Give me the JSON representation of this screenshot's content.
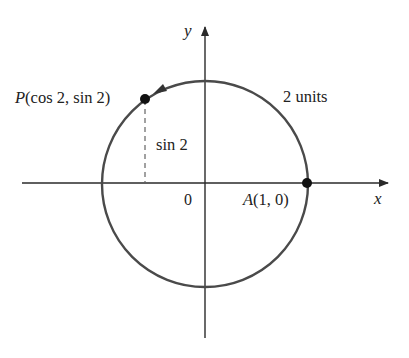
{
  "figure": {
    "type": "unit-circle-angle-diagram",
    "axes": {
      "x_label": "x",
      "y_label": "y",
      "origin_label": "0"
    },
    "points": {
      "P": {
        "name": "P",
        "coords_text": "(cos 2, sin 2)"
      },
      "A": {
        "name": "A",
        "coords_text": "(1, 0)"
      }
    },
    "annotations": {
      "arc_length": "2 units",
      "vertical_segment": "sin 2"
    },
    "colors": {
      "axis": "#2a2a2a",
      "circle": "#4a4a4a",
      "point": "#111111",
      "text": "#222222"
    }
  }
}
